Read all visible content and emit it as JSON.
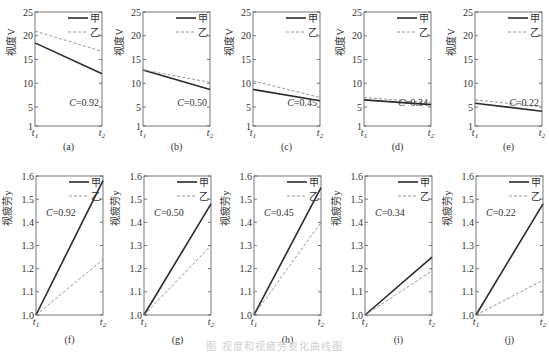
{
  "figure": {
    "caption": "图 视度和视疲劳变化曲线图",
    "legend": {
      "series_a": "甲",
      "series_b": "乙"
    },
    "colors": {
      "series_a": "#2a2a2a",
      "series_b": "#8a8a8a",
      "axis": "#555555"
    }
  },
  "chart_data": [
    {
      "panel": "(a)",
      "type": "line",
      "ylabel": "视度V",
      "x": [
        "t1",
        "t2"
      ],
      "yticks": [
        1,
        5,
        10,
        15,
        20,
        25
      ],
      "ylim": [
        1,
        25
      ],
      "annotation": "C=0.92",
      "series": [
        {
          "name": "甲",
          "style": "solid",
          "values": [
            18.5,
            12.0
          ]
        },
        {
          "name": "乙",
          "style": "dashed",
          "values": [
            21.0,
            16.7
          ]
        }
      ]
    },
    {
      "panel": "(b)",
      "type": "line",
      "ylabel": "视度V",
      "x": [
        "t1",
        "t2"
      ],
      "yticks": [
        1,
        5,
        10,
        15,
        20,
        25
      ],
      "ylim": [
        1,
        25
      ],
      "annotation": "C=0.50",
      "series": [
        {
          "name": "甲",
          "style": "solid",
          "values": [
            12.8,
            8.7
          ]
        },
        {
          "name": "乙",
          "style": "dashed",
          "values": [
            12.8,
            10.2
          ]
        }
      ]
    },
    {
      "panel": "(c)",
      "type": "line",
      "ylabel": "视度V",
      "x": [
        "t1",
        "t2"
      ],
      "yticks": [
        1,
        5,
        10,
        15,
        20,
        25
      ],
      "ylim": [
        1,
        25
      ],
      "annotation": "C=0.45",
      "series": [
        {
          "name": "甲",
          "style": "solid",
          "values": [
            8.7,
            6.3
          ]
        },
        {
          "name": "乙",
          "style": "dashed",
          "values": [
            10.5,
            7.0
          ]
        }
      ]
    },
    {
      "panel": "(d)",
      "type": "line",
      "ylabel": "视度V",
      "x": [
        "t1",
        "t2"
      ],
      "yticks": [
        1,
        5,
        10,
        15,
        20,
        25
      ],
      "ylim": [
        1,
        25
      ],
      "annotation": "C=0.34",
      "series": [
        {
          "name": "甲",
          "style": "solid",
          "values": [
            6.5,
            5.5
          ]
        },
        {
          "name": "乙",
          "style": "dashed",
          "values": [
            7.0,
            5.9
          ]
        }
      ]
    },
    {
      "panel": "(e)",
      "type": "line",
      "ylabel": "视度V",
      "x": [
        "t1",
        "t2"
      ],
      "yticks": [
        1,
        5,
        10,
        15,
        20,
        25
      ],
      "ylim": [
        1,
        25
      ],
      "annotation": "C=0.22",
      "series": [
        {
          "name": "甲",
          "style": "solid",
          "values": [
            5.8,
            4.1
          ]
        },
        {
          "name": "乙",
          "style": "dashed",
          "values": [
            6.5,
            5.0
          ]
        }
      ]
    },
    {
      "panel": "(f)",
      "type": "line",
      "ylabel": "视疲劳y",
      "x": [
        "t1",
        "t2"
      ],
      "yticks": [
        1.0,
        1.1,
        1.2,
        1.3,
        1.4,
        1.5,
        1.6
      ],
      "ylim": [
        1.0,
        1.6
      ],
      "annotation": "C=0.92",
      "series": [
        {
          "name": "甲",
          "style": "solid",
          "values": [
            1.0,
            1.58
          ]
        },
        {
          "name": "乙",
          "style": "dashed",
          "values": [
            1.0,
            1.24
          ]
        }
      ]
    },
    {
      "panel": "(g)",
      "type": "line",
      "ylabel": "视疲劳y",
      "x": [
        "t1",
        "t2"
      ],
      "yticks": [
        1.0,
        1.1,
        1.2,
        1.3,
        1.4,
        1.5,
        1.6
      ],
      "ylim": [
        1.0,
        1.6
      ],
      "annotation": "C=0.50",
      "series": [
        {
          "name": "甲",
          "style": "solid",
          "values": [
            1.0,
            1.48
          ]
        },
        {
          "name": "乙",
          "style": "dashed",
          "values": [
            1.0,
            1.3
          ]
        }
      ]
    },
    {
      "panel": "(h)",
      "type": "line",
      "ylabel": "视疲劳y",
      "x": [
        "t1",
        "t2"
      ],
      "yticks": [
        1.0,
        1.1,
        1.2,
        1.3,
        1.4,
        1.5,
        1.6
      ],
      "ylim": [
        1.0,
        1.6
      ],
      "annotation": "C=0.45",
      "series": [
        {
          "name": "甲",
          "style": "solid",
          "values": [
            1.0,
            1.55
          ]
        },
        {
          "name": "乙",
          "style": "dashed",
          "values": [
            1.0,
            1.4
          ]
        }
      ]
    },
    {
      "panel": "(i)",
      "type": "line",
      "ylabel": "视疲劳y",
      "x": [
        "t1",
        "t2"
      ],
      "yticks": [
        1.0,
        1.1,
        1.2,
        1.3,
        1.4,
        1.5,
        1.6
      ],
      "ylim": [
        1.0,
        1.6
      ],
      "annotation": "C=0.34",
      "series": [
        {
          "name": "甲",
          "style": "solid",
          "values": [
            1.0,
            1.25
          ]
        },
        {
          "name": "乙",
          "style": "dashed",
          "values": [
            1.0,
            1.19
          ]
        }
      ]
    },
    {
      "panel": "(j)",
      "type": "line",
      "ylabel": "视疲劳y",
      "x": [
        "t1",
        "t2"
      ],
      "yticks": [
        1.0,
        1.1,
        1.2,
        1.3,
        1.4,
        1.5,
        1.6
      ],
      "ylim": [
        1.0,
        1.6
      ],
      "annotation": "C=0.22",
      "series": [
        {
          "name": "甲",
          "style": "solid",
          "values": [
            1.0,
            1.48
          ]
        },
        {
          "name": "乙",
          "style": "dashed",
          "values": [
            1.0,
            1.15
          ]
        }
      ]
    }
  ]
}
